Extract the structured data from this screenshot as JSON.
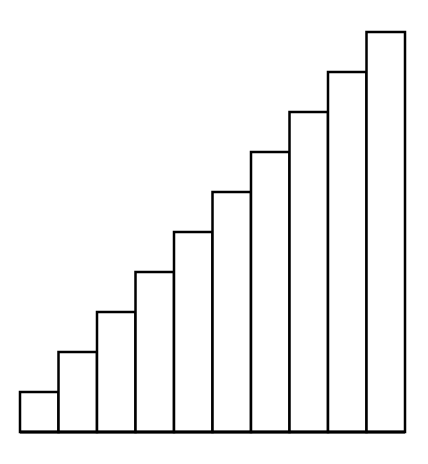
{
  "chart_data": {
    "type": "bar",
    "title": "",
    "xlabel": "",
    "ylabel": "",
    "categories": [
      "1",
      "2",
      "3",
      "4",
      "5",
      "6",
      "7",
      "8",
      "9",
      "10"
    ],
    "values": [
      1,
      2,
      3,
      4,
      5,
      6,
      7,
      8,
      9,
      10
    ],
    "ylim": [
      0,
      10
    ],
    "grid": false,
    "legend": null,
    "colors": {
      "fill": "#ffffff",
      "stroke": "#000000"
    }
  }
}
